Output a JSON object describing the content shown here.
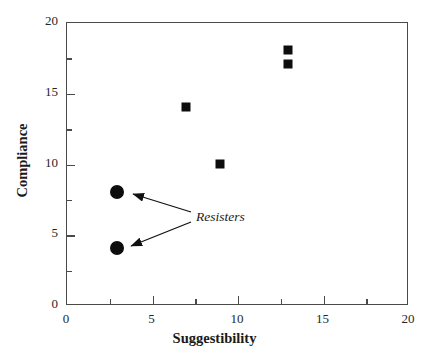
{
  "chart_data": {
    "type": "scatter",
    "title": "",
    "xlabel": "Suggestibility",
    "ylabel": "Compliance",
    "xlim": [
      0,
      20
    ],
    "ylim": [
      0,
      20
    ],
    "grid": false,
    "legend": "none",
    "x_ticks_major": [
      0,
      5,
      10,
      15,
      20
    ],
    "x_ticks_minor": [
      2.5,
      7.5,
      12.5,
      17.5
    ],
    "y_ticks_major": [
      0,
      5,
      10,
      15,
      20
    ],
    "y_ticks_minor": [
      2.5,
      7.5,
      12.5,
      17.5
    ],
    "x_tick_labels": [
      "0",
      "5",
      "10",
      "15",
      "20"
    ],
    "y_tick_labels": [
      "0",
      "5",
      "10",
      "15",
      "20"
    ],
    "series": [
      {
        "name": "compliant",
        "marker": "square",
        "color": "#0d0d0d",
        "points": [
          {
            "x": 7,
            "y": 14
          },
          {
            "x": 9,
            "y": 10
          },
          {
            "x": 13,
            "y": 18
          },
          {
            "x": 13,
            "y": 17
          }
        ]
      },
      {
        "name": "resisters",
        "marker": "circle",
        "color": "#0d0d0d",
        "points": [
          {
            "x": 3,
            "y": 8
          },
          {
            "x": 3,
            "y": 4
          }
        ]
      }
    ],
    "annotations": [
      {
        "text": "Resisters",
        "style": "italic",
        "points_to": [
          {
            "x": 3,
            "y": 8
          },
          {
            "x": 3,
            "y": 4
          }
        ]
      }
    ]
  },
  "axes": {
    "x_title": "Suggestibility",
    "y_title": "Compliance",
    "x_labels": [
      "0",
      "5",
      "10",
      "15",
      "20"
    ],
    "y_labels": [
      "0",
      "5",
      "10",
      "15",
      "20"
    ]
  },
  "annotation": {
    "label": "Resisters"
  },
  "colors": {
    "marker": "#0d0d0d",
    "axis": "#4a4a4a",
    "text": "#1a1a1a",
    "background": "#ffffff"
  }
}
